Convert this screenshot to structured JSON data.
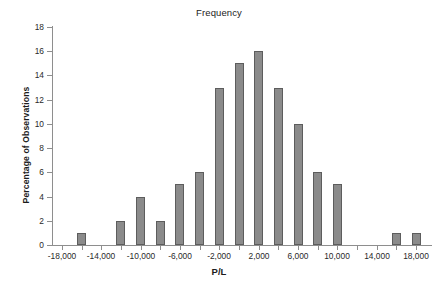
{
  "chart_data": {
    "type": "bar",
    "title": "Frequency",
    "xlabel": "P/L",
    "ylabel": "Percentage of Observations",
    "grid": false,
    "legend": false,
    "bar_color": "#8b8b8b",
    "bar_edge_color": "#5d5d5d",
    "axis_color": "#8e8e8e",
    "bin_width": 2000,
    "xlim": [
      -19000,
      19000
    ],
    "ylim": [
      0,
      18
    ],
    "x_tick_labels": [
      "-18,000",
      "-14,000",
      "-10,000",
      "-6,000",
      "-2,000",
      "2,000",
      "6,000",
      "10,000",
      "14,000",
      "18,000"
    ],
    "x_tick_values": [
      -18000,
      -14000,
      -10000,
      -6000,
      -2000,
      2000,
      6000,
      10000,
      14000,
      18000
    ],
    "x_minor_tick_values": [
      -16000,
      -12000,
      -8000,
      -4000,
      0,
      4000,
      8000,
      12000,
      16000
    ],
    "y_tick_labels": [
      "0",
      "2",
      "4",
      "6",
      "8",
      "10",
      "12",
      "14",
      "16",
      "18"
    ],
    "y_tick_values": [
      0,
      2,
      4,
      6,
      8,
      10,
      12,
      14,
      16,
      18
    ],
    "categories": [
      -16000,
      -14000,
      -12000,
      -10000,
      -8000,
      -6000,
      -4000,
      -2000,
      0,
      2000,
      4000,
      6000,
      8000,
      10000,
      12000,
      14000,
      16000,
      18000
    ],
    "values": [
      1,
      0,
      2,
      4,
      2,
      5,
      6,
      13,
      15,
      16,
      13,
      10,
      6,
      5,
      0,
      0,
      1,
      1
    ]
  }
}
